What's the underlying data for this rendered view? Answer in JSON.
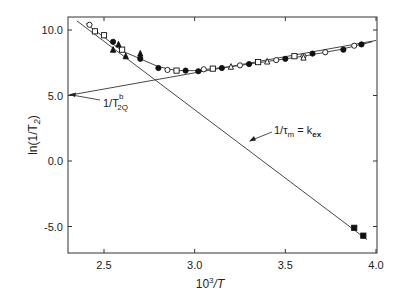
{
  "chart_data": {
    "type": "scatter",
    "title": "",
    "xlabel": "10^3/T",
    "ylabel": "ln(1/T2)",
    "xlim": [
      2.3,
      4.0
    ],
    "ylim": [
      -6.0,
      11.0
    ],
    "grid": false,
    "xticks": [
      2.5,
      3.0,
      3.5,
      4.0
    ],
    "xtick_labels": [
      "2.5",
      "3.0",
      "3.5",
      "4.0"
    ],
    "yticks": [
      10.0,
      5.0,
      0.0,
      -5.0
    ],
    "ytick_labels": [
      "10.0",
      "5.0",
      "0.0",
      "-5.0"
    ],
    "lines": [
      {
        "name": "1/T2Q^b",
        "label": "1/T2Q b",
        "x": [
          2.3,
          4.0
        ],
        "y": [
          5.0,
          9.2
        ]
      },
      {
        "name": "1/tau_m = k_ex",
        "label": "1/τm = kex",
        "x": [
          2.35,
          3.95
        ],
        "y": [
          10.7,
          -6.0
        ]
      },
      {
        "name": "fit",
        "x": [
          2.4,
          2.6,
          2.8,
          2.9,
          3.0,
          3.2,
          3.4,
          3.6,
          3.8,
          3.98
        ],
        "y": [
          10.5,
          8.4,
          7.2,
          6.9,
          6.9,
          7.2,
          7.6,
          8.0,
          8.5,
          9.1
        ]
      }
    ],
    "series": [
      {
        "name": "open circles",
        "marker": "circle-open",
        "x": [
          2.42,
          2.85,
          3.05,
          3.25,
          3.45,
          3.6,
          3.72,
          3.88
        ],
        "y": [
          10.4,
          6.95,
          7.0,
          7.3,
          7.7,
          8.0,
          8.3,
          8.8
        ]
      },
      {
        "name": "open squares",
        "marker": "square-open",
        "x": [
          2.45,
          2.5,
          2.6,
          2.9,
          3.1,
          3.35,
          3.55
        ],
        "y": [
          9.9,
          9.6,
          8.5,
          6.9,
          7.05,
          7.55,
          8.0
        ]
      },
      {
        "name": "filled circles",
        "marker": "circle-filled",
        "x": [
          2.55,
          2.7,
          2.8,
          2.95,
          3.02,
          3.15,
          3.3,
          3.5,
          3.65,
          3.82,
          3.92
        ],
        "y": [
          9.1,
          7.8,
          7.1,
          6.9,
          6.85,
          7.1,
          7.4,
          7.8,
          8.2,
          8.5,
          8.9
        ]
      },
      {
        "name": "filled triangles",
        "marker": "triangle-filled",
        "x": [
          2.55,
          2.58,
          2.62,
          2.7
        ],
        "y": [
          8.5,
          8.9,
          8.0,
          8.2
        ]
      },
      {
        "name": "open triangles",
        "marker": "triangle-open",
        "x": [
          3.2,
          3.4,
          3.6
        ],
        "y": [
          7.2,
          7.6,
          7.9
        ]
      },
      {
        "name": "filled squares",
        "marker": "square-filled",
        "x": [
          3.88,
          3.93
        ],
        "y": [
          -5.1,
          -5.7
        ]
      }
    ],
    "annotations": [
      {
        "text_main": "1/T",
        "text_sub": "2Q",
        "text_sup": "b",
        "arrow_to": [
          2.3,
          5.0
        ]
      },
      {
        "text_main": "1/τ",
        "text_sub": "m",
        "text_mid": " = k",
        "text_sub2": "ex",
        "arrow_to": [
          3.2,
          0.0
        ]
      }
    ]
  },
  "labels": {
    "ylabel_main": "ln(1/T",
    "ylabel_sub": "2",
    "ylabel_end": ")",
    "xlabel_main": "10",
    "xlabel_sup": "3",
    "xlabel_end": "/T",
    "annot1_main": "1/T",
    "annot1_sub": "2Q",
    "annot1_sup": "b",
    "annot2_main": "1/τ",
    "annot2_sub": "m",
    "annot2_mid": " = k",
    "annot2_sub2": "ex"
  }
}
